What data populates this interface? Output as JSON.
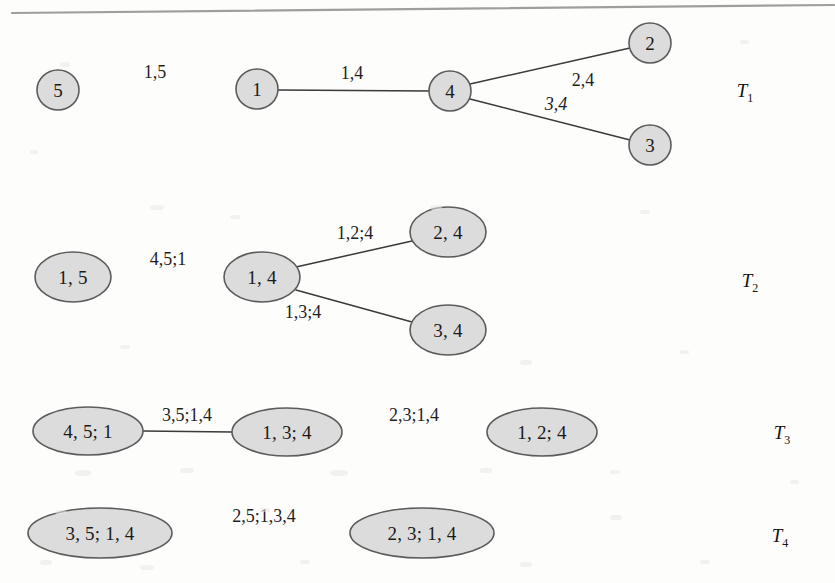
{
  "page": {
    "width": 835,
    "height": 583,
    "background_color": "#fdfdfc",
    "node_fill_color": "#dcdcdc",
    "node_stroke_color": "#5b5b5b",
    "edge_color": "#3a3a3a",
    "text_color": "#1a1a1a",
    "scan_edge_color": "#8e8e8e"
  },
  "trees": [
    {
      "id": "T1",
      "name": "T",
      "subscript": "1",
      "name_x": 745,
      "name_y": 93,
      "nodes": [
        {
          "id": "n5",
          "label": "5",
          "cx": 58,
          "cy": 90,
          "rx": 21,
          "ry": 20,
          "font_size": 19
        },
        {
          "id": "n1",
          "label": "1",
          "cx": 257,
          "cy": 89,
          "rx": 21,
          "ry": 20,
          "font_size": 19
        },
        {
          "id": "n4",
          "label": "4",
          "cx": 450,
          "cy": 91,
          "rx": 21,
          "ry": 20,
          "font_size": 19
        },
        {
          "id": "n2",
          "label": "2",
          "cx": 650,
          "cy": 43,
          "rx": 21,
          "ry": 20,
          "font_size": 19
        },
        {
          "id": "n3",
          "label": "3",
          "cx": 650,
          "cy": 145,
          "rx": 21,
          "ry": 20,
          "font_size": 19
        }
      ],
      "edges": [
        {
          "from": "n5",
          "to": "n1",
          "x1": 79,
          "y1": 89,
          "x2": 236,
          "y2": 89,
          "label": "1,5",
          "label_x": 155,
          "label_y": 72,
          "slanted": false
        },
        {
          "from": "n1",
          "to": "n4",
          "x1": 278,
          "y1": 90,
          "x2": 429,
          "y2": 91,
          "label": "1,4",
          "label_x": 352,
          "label_y": 73,
          "slanted": false
        },
        {
          "from": "n4",
          "to": "n2",
          "x1": 470,
          "y1": 84,
          "x2": 630,
          "y2": 48,
          "label": "2,4",
          "label_x": 583,
          "label_y": 80,
          "slanted": false
        },
        {
          "from": "n4",
          "to": "n3",
          "x1": 470,
          "y1": 99,
          "x2": 630,
          "y2": 140,
          "label": "3,4",
          "label_x": 556,
          "label_y": 104,
          "slanted": true
        }
      ]
    },
    {
      "id": "T2",
      "name": "T",
      "subscript": "2",
      "name_x": 750,
      "name_y": 283,
      "nodes": [
        {
          "id": "m15",
          "label": "1, 5",
          "cx": 73,
          "cy": 277,
          "rx": 38,
          "ry": 25,
          "font_size": 19
        },
        {
          "id": "m14",
          "label": "1, 4",
          "cx": 262,
          "cy": 277,
          "rx": 38,
          "ry": 25,
          "font_size": 19
        },
        {
          "id": "m24",
          "label": "2, 4",
          "cx": 448,
          "cy": 232,
          "rx": 38,
          "ry": 25,
          "font_size": 19
        },
        {
          "id": "m34",
          "label": "3, 4",
          "cx": 448,
          "cy": 330,
          "rx": 38,
          "ry": 25,
          "font_size": 19
        }
      ],
      "edges": [
        {
          "from": "m15",
          "to": "m14",
          "x1": 111,
          "y1": 278,
          "x2": 224,
          "y2": 278,
          "label": "4,5;1",
          "label_x": 168,
          "label_y": 259,
          "slanted": false
        },
        {
          "from": "m14",
          "to": "m24",
          "x1": 296,
          "y1": 267,
          "x2": 412,
          "y2": 241,
          "label": "1,2;4",
          "label_x": 355,
          "label_y": 233,
          "slanted": false
        },
        {
          "from": "m14",
          "to": "m34",
          "x1": 296,
          "y1": 290,
          "x2": 412,
          "y2": 322,
          "label": "1,3;4",
          "label_x": 303,
          "label_y": 312,
          "slanted": false
        }
      ]
    },
    {
      "id": "T3",
      "name": "T",
      "subscript": "3",
      "name_x": 782,
      "name_y": 435,
      "nodes": [
        {
          "id": "p451",
          "label": "4, 5; 1",
          "cx": 88,
          "cy": 431,
          "rx": 55,
          "ry": 24,
          "font_size": 19
        },
        {
          "id": "p134",
          "label": "1, 3; 4",
          "cx": 287,
          "cy": 432,
          "rx": 55,
          "ry": 24,
          "font_size": 19
        },
        {
          "id": "p124",
          "label": "1, 2; 4",
          "cx": 542,
          "cy": 432,
          "rx": 55,
          "ry": 24,
          "font_size": 19
        }
      ],
      "edges": [
        {
          "from": "p451",
          "to": "p134",
          "x1": 143,
          "y1": 431,
          "x2": 232,
          "y2": 432,
          "label": "3,5;1,4",
          "label_x": 187,
          "label_y": 415,
          "slanted": false
        },
        {
          "from": "p134",
          "to": "p124",
          "x1": 342,
          "y1": 432,
          "x2": 487,
          "y2": 432,
          "label": "2,3;1,4",
          "label_x": 414,
          "label_y": 415,
          "slanted": false
        }
      ]
    },
    {
      "id": "T4",
      "name": "T",
      "subscript": "4",
      "name_x": 780,
      "name_y": 538,
      "nodes": [
        {
          "id": "q3514",
          "label": "3, 5; 1, 4",
          "cx": 100,
          "cy": 533,
          "rx": 72,
          "ry": 25,
          "font_size": 19
        },
        {
          "id": "q2314",
          "label": "2, 3; 1, 4",
          "cx": 422,
          "cy": 533,
          "rx": 72,
          "ry": 25,
          "font_size": 19
        }
      ],
      "edges": [
        {
          "from": "q3514",
          "to": "q2314",
          "x1": 172,
          "y1": 533,
          "x2": 350,
          "y2": 533,
          "label": "2,5;1,3,4",
          "label_x": 264,
          "label_y": 516,
          "slanted": false
        }
      ]
    }
  ],
  "scan_artifact": {
    "description": "page-edge-line",
    "x1": 12,
    "y1": 13,
    "x2": 834,
    "y2": 5,
    "thickness": 2.2
  }
}
